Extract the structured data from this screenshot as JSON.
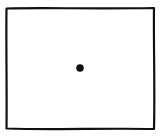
{
  "figure": {
    "stroke_color": "#111111",
    "background_color": "#ffffff",
    "rectangle": {
      "x": 6,
      "y": 8,
      "width": 148,
      "height": 121
    },
    "dot": {
      "cx": 80,
      "cy": 68,
      "r": 3.8
    }
  }
}
